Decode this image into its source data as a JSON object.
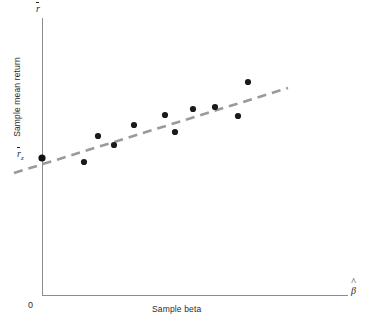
{
  "figure": {
    "background_color": "#ffffff",
    "axis_color": "#8c8c8c",
    "point_color": "#1a1a1a",
    "line_color": "#9a9a9a"
  },
  "labels": {
    "ylabel": "Sample mean return",
    "xlabel": "Sample beta",
    "origin": "0",
    "y_axis_symbol_base": "r",
    "y_intercept_symbol_base": "r",
    "y_intercept_symbol_sub": "z",
    "x_axis_symbol_base": "β"
  },
  "chart_data": {
    "type": "scatter",
    "title": "",
    "xlabel": "Sample beta",
    "ylabel": "Sample mean return",
    "x_axis_symbol": "β̂",
    "y_axis_symbol": "r̄",
    "intercept_label": "r̄z",
    "grid": false,
    "legend": false,
    "axis_origin_label": "0",
    "xlim": [
      0,
      1
    ],
    "ylim": [
      0,
      1
    ],
    "points_px": [
      {
        "x": 84,
        "y": 162
      },
      {
        "x": 98,
        "y": 136
      },
      {
        "x": 114,
        "y": 145
      },
      {
        "x": 134,
        "y": 125
      },
      {
        "x": 165,
        "y": 115
      },
      {
        "x": 175,
        "y": 132
      },
      {
        "x": 193,
        "y": 109
      },
      {
        "x": 215,
        "y": 107
      },
      {
        "x": 238,
        "y": 116
      },
      {
        "x": 248,
        "y": 82
      }
    ],
    "points_normalized": [
      {
        "x": 0.137,
        "y": 0.582
      },
      {
        "x": 0.183,
        "y": 0.677
      },
      {
        "x": 0.235,
        "y": 0.644
      },
      {
        "x": 0.301,
        "y": 0.717
      },
      {
        "x": 0.402,
        "y": 0.753
      },
      {
        "x": 0.435,
        "y": 0.691
      },
      {
        "x": 0.494,
        "y": 0.775
      },
      {
        "x": 0.566,
        "y": 0.783
      },
      {
        "x": 0.641,
        "y": 0.75
      },
      {
        "x": 0.673,
        "y": 0.874
      }
    ],
    "intercept_point_px": {
      "x": 42,
      "y": 158
    },
    "fit_line_px": {
      "x1": 14,
      "y1": 173,
      "x2": 288,
      "y2": 88
    },
    "fit_line_style": "dashed",
    "annotations": [
      {
        "text": "r̄",
        "position": "y-axis-top"
      },
      {
        "text": "r̄z",
        "position": "y-axis-intercept"
      },
      {
        "text": "β̂",
        "position": "x-axis-right"
      },
      {
        "text": "0",
        "position": "origin"
      }
    ],
    "axes_px": {
      "y_axis": {
        "x": 42,
        "y_top": 18,
        "y_bottom": 295
      },
      "x_axis": {
        "y": 295,
        "x_left": 42,
        "x_right": 348
      }
    }
  }
}
